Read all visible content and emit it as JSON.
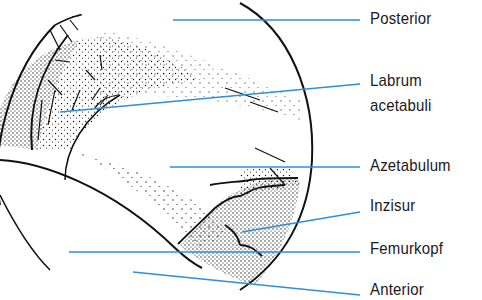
{
  "diagram": {
    "type": "anatomical-illustration",
    "leader_color": "#2f8fd8",
    "ink_color": "#111111",
    "labels": [
      {
        "id": "posterior",
        "text": "Posterior"
      },
      {
        "id": "labrum",
        "line1": "Labrum",
        "line2": "acetabuli"
      },
      {
        "id": "azetabulum",
        "text": "Azetabulum"
      },
      {
        "id": "inzisur",
        "text": "Inzisur"
      },
      {
        "id": "femurkopf",
        "text": "Femurkopf"
      },
      {
        "id": "anterior",
        "text": "Anterior"
      }
    ]
  }
}
